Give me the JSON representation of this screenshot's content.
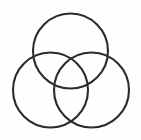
{
  "image": {
    "kind": "line-drawing",
    "subject": "three-overlapping-circles",
    "description": "Three equal circles arranged in a triangular pattern, each pair overlapping, forming a three-set Venn diagram outline",
    "width": 141,
    "height": 140,
    "background_color": "#fefefe",
    "has_text": false,
    "has_fill": false
  },
  "style": {
    "stroke_color": "#2b2b2b",
    "stroke_width": 2.1,
    "fill": "none"
  },
  "figure": {
    "label": "three-circle-venn-outline",
    "circles": [
      {
        "name": "top-circle",
        "position": "top",
        "cx": 70.5,
        "cy": 51,
        "r": 37.5
      },
      {
        "name": "bottom-left-circle",
        "position": "bottom-left",
        "cx": 50.5,
        "cy": 90,
        "r": 37.5
      },
      {
        "name": "bottom-right-circle",
        "position": "bottom-right",
        "cx": 91.5,
        "cy": 90,
        "r": 37.5
      }
    ]
  }
}
